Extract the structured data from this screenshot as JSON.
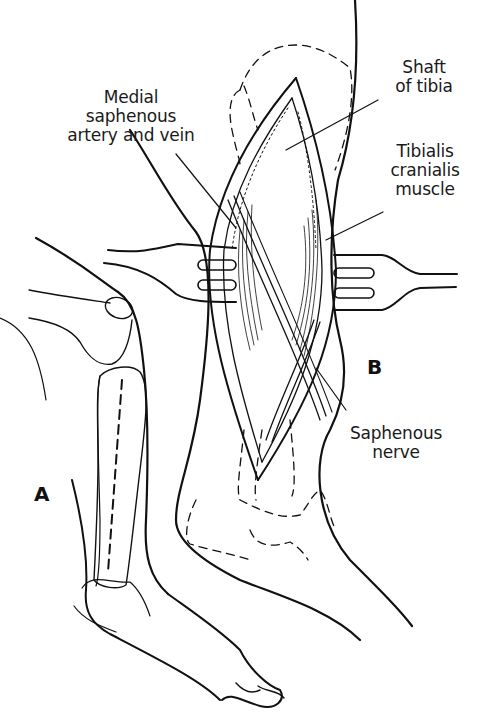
{
  "figure": {
    "panels": [
      {
        "id": "A",
        "label": "A",
        "description": "Lateral view of canine hind limb with incision line along tibia"
      },
      {
        "id": "B",
        "label": "B",
        "description": "Medial surgical approach to tibial shaft with retractors"
      }
    ],
    "labels": {
      "medial_saphenous": [
        "Medial",
        "saphenous",
        "artery and vein"
      ],
      "shaft_of_tibia": [
        "Shaft",
        "of tibia"
      ],
      "tibialis_cranialis": [
        "Tibialis",
        "cranialis",
        "muscle"
      ],
      "saphenous_nerve": [
        "Saphenous",
        "nerve"
      ]
    },
    "colors": {
      "line": "#111111",
      "background": "#ffffff",
      "text": "#1a1a1a"
    }
  }
}
